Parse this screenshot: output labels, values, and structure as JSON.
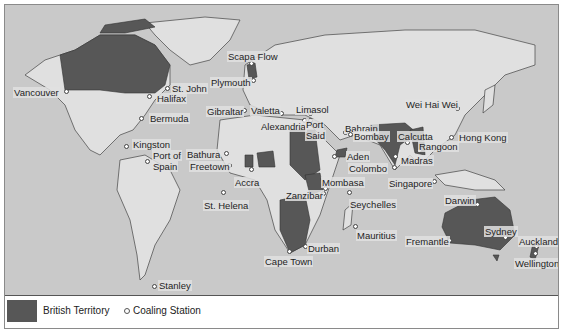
{
  "map": {
    "title": "British Empire coaling stations",
    "colors": {
      "sea": "#c9c9c9",
      "land": "#e0e0e0",
      "british_territory": "#575757",
      "border": "#444444"
    },
    "stations": [
      {
        "name": "Vancouver",
        "x": 62,
        "y": 87,
        "lx": 8,
        "ly": 82
      },
      {
        "name": "St. John",
        "x": 163,
        "y": 84,
        "lx": 166,
        "ly": 78
      },
      {
        "name": "Halifax",
        "x": 145,
        "y": 92,
        "lx": 151,
        "ly": 88
      },
      {
        "name": "Bermuda",
        "x": 137,
        "y": 114,
        "lx": 144,
        "ly": 108
      },
      {
        "name": "Kingston",
        "x": 122,
        "y": 142,
        "lx": 127,
        "ly": 134
      },
      {
        "name": "Port of",
        "x": 143,
        "y": 157,
        "lx": 147,
        "ly": 145
      },
      {
        "name": "Spain",
        "x": 143,
        "y": 157,
        "lx": 147,
        "ly": 156
      },
      {
        "name": "Scapa Flow",
        "x": 247,
        "y": 59,
        "lx": 222,
        "ly": 46
      },
      {
        "name": "Plymouth",
        "x": 249,
        "y": 76,
        "lx": 205,
        "ly": 72
      },
      {
        "name": "Gibraltar",
        "x": 240,
        "y": 106,
        "lx": 201,
        "ly": 101
      },
      {
        "name": "Valetta",
        "x": 277,
        "y": 109,
        "lx": 245,
        "ly": 100
      },
      {
        "name": "Limasol",
        "x": 306,
        "y": 109,
        "lx": 290,
        "ly": 99
      },
      {
        "name": "Alexandria",
        "x": 300,
        "y": 116,
        "lx": 255,
        "ly": 116
      },
      {
        "name": "Port",
        "x": 306,
        "y": 116,
        "lx": 300,
        "ly": 114
      },
      {
        "name": "Said",
        "x": 306,
        "y": 116,
        "lx": 300,
        "ly": 125
      },
      {
        "name": "Bahrain",
        "x": 341,
        "y": 128,
        "lx": 339,
        "ly": 118
      },
      {
        "name": "Bombay",
        "x": 346,
        "y": 130,
        "lx": 348,
        "ly": 126
      },
      {
        "name": "Aden",
        "x": 330,
        "y": 152,
        "lx": 341,
        "ly": 146
      },
      {
        "name": "Colombo",
        "x": 390,
        "y": 163,
        "lx": 343,
        "ly": 158
      },
      {
        "name": "Calcutta",
        "x": 403,
        "y": 138,
        "lx": 392,
        "ly": 126
      },
      {
        "name": "Rangoon",
        "x": 415,
        "y": 146,
        "lx": 413,
        "ly": 136
      },
      {
        "name": "Madras",
        "x": 391,
        "y": 152,
        "lx": 395,
        "ly": 150
      },
      {
        "name": "Wei Hai Wei",
        "x": 453,
        "y": 104,
        "lx": 400,
        "ly": 94
      },
      {
        "name": "Hong Kong",
        "x": 447,
        "y": 133,
        "lx": 453,
        "ly": 127
      },
      {
        "name": "Singapore",
        "x": 430,
        "y": 177,
        "lx": 383,
        "ly": 173
      },
      {
        "name": "Bathura",
        "x": 222,
        "y": 149,
        "lx": 181,
        "ly": 144
      },
      {
        "name": "Freetown",
        "x": 225,
        "y": 161,
        "lx": 184,
        "ly": 156
      },
      {
        "name": "Accra",
        "x": 247,
        "y": 165,
        "lx": 229,
        "ly": 172
      },
      {
        "name": "St. Helena",
        "x": 219,
        "y": 188,
        "lx": 198,
        "ly": 195
      },
      {
        "name": "Mombasa",
        "x": 321,
        "y": 184,
        "lx": 316,
        "ly": 172
      },
      {
        "name": "Zanzibar",
        "x": 319,
        "y": 189,
        "lx": 280,
        "ly": 185
      },
      {
        "name": "Seychelles",
        "x": 345,
        "y": 188,
        "lx": 344,
        "ly": 194
      },
      {
        "name": "Mauritius",
        "x": 351,
        "y": 222,
        "lx": 351,
        "ly": 225
      },
      {
        "name": "Durban",
        "x": 301,
        "y": 242,
        "lx": 302,
        "ly": 238
      },
      {
        "name": "Cape Town",
        "x": 285,
        "y": 247,
        "lx": 259,
        "ly": 251
      },
      {
        "name": "Darwin",
        "x": 473,
        "y": 200,
        "lx": 439,
        "ly": 190
      },
      {
        "name": "Fremantle",
        "x": 445,
        "y": 236,
        "lx": 400,
        "ly": 231
      },
      {
        "name": "Sydney",
        "x": 501,
        "y": 233,
        "lx": 479,
        "ly": 221
      },
      {
        "name": "Auckland",
        "x": 532,
        "y": 242,
        "lx": 513,
        "ly": 231
      },
      {
        "name": "Wellington",
        "x": 531,
        "y": 249,
        "lx": 509,
        "ly": 253
      },
      {
        "name": "Stanley",
        "x": 150,
        "y": 282,
        "lx": 153,
        "ly": 275
      }
    ]
  },
  "legend": {
    "british_territory_label": "British Territory",
    "coaling_station_label": "Coaling Station"
  }
}
